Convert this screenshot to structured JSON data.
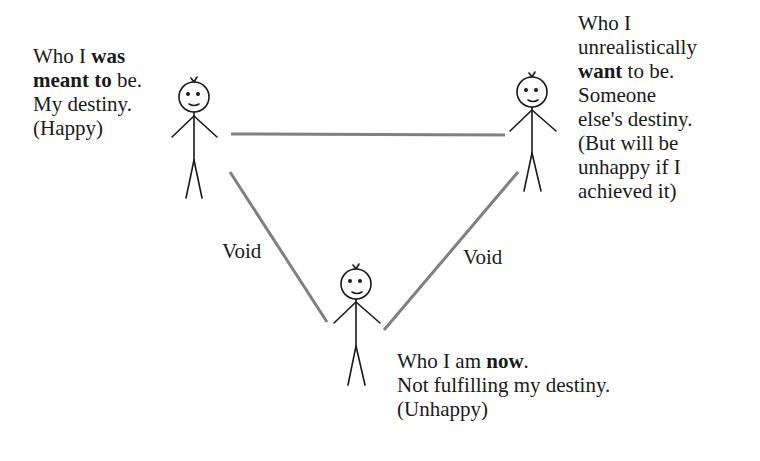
{
  "diagram": {
    "type": "triangle-relationship",
    "nodes": [
      {
        "id": "meant-to-be",
        "lines": [
          [
            {
              "t": "Who I "
            },
            {
              "t": "was",
              "b": true
            }
          ],
          [
            {
              "t": "meant to",
              "b": true
            },
            {
              "t": " be."
            }
          ],
          [
            {
              "t": "My destiny."
            }
          ],
          [
            {
              "t": "(Happy)"
            }
          ]
        ]
      },
      {
        "id": "want-to-be",
        "lines": [
          [
            {
              "t": "Who I"
            }
          ],
          [
            {
              "t": "unrealistically"
            }
          ],
          [
            {
              "t": "want",
              "b": true
            },
            {
              "t": " to be."
            }
          ],
          [
            {
              "t": "Someone"
            }
          ],
          [
            {
              "t": "else's destiny."
            }
          ],
          [
            {
              "t": "(But will be"
            }
          ],
          [
            {
              "t": "unhappy if I"
            }
          ],
          [
            {
              "t": "achieved it)"
            }
          ]
        ]
      },
      {
        "id": "am-now",
        "lines": [
          [
            {
              "t": "Who I am "
            },
            {
              "t": "now",
              "b": true
            },
            {
              "t": "."
            }
          ],
          [
            {
              "t": "Not fulfilling my destiny."
            }
          ],
          [
            {
              "t": "(Unhappy)"
            }
          ]
        ]
      }
    ],
    "edges": [
      {
        "from": "meant-to-be",
        "to": "want-to-be",
        "label": ""
      },
      {
        "from": "meant-to-be",
        "to": "am-now",
        "label": "Void"
      },
      {
        "from": "want-to-be",
        "to": "am-now",
        "label": "Void"
      }
    ],
    "edge_labels": {
      "left": "Void",
      "right": "Void"
    },
    "colors": {
      "edge": "#808080",
      "figure": "#1a1a1a",
      "text": "#1a1a1a",
      "background": "#ffffff"
    }
  }
}
